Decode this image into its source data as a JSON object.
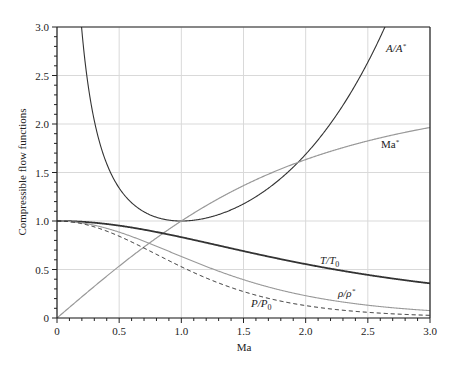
{
  "chart_data": {
    "type": "line",
    "title": "",
    "xlabel": "Ma",
    "ylabel": "Compressible flow functions",
    "xlim": [
      0,
      3.0
    ],
    "ylim": [
      0,
      3.0
    ],
    "grid": true,
    "legend": "inline labels",
    "x_ticks": [
      "0",
      "0.5",
      "1.0",
      "1.5",
      "2.0",
      "2.5",
      "3.0"
    ],
    "y_ticks": [
      "0",
      "0.5",
      "1.0",
      "1.5",
      "2.0",
      "2.5",
      "3.0"
    ],
    "x": [
      0,
      0.1,
      0.2,
      0.3,
      0.4,
      0.5,
      0.6,
      0.7,
      0.8,
      0.9,
      1.0,
      1.1,
      1.2,
      1.3,
      1.4,
      1.5,
      1.6,
      1.7,
      1.8,
      1.9,
      2.0,
      2.1,
      2.2,
      2.3,
      2.4,
      2.5,
      2.6,
      2.7,
      2.8,
      2.9,
      3.0
    ],
    "series": [
      {
        "name": "A/A*",
        "label": "A/A",
        "label_sup": "*",
        "style": "solid",
        "color": "#333333",
        "width": 1.1,
        "values": [
          null,
          5.822,
          2.964,
          2.035,
          1.59,
          1.34,
          1.188,
          1.094,
          1.038,
          1.009,
          1.0,
          1.008,
          1.03,
          1.066,
          1.115,
          1.176,
          1.25,
          1.338,
          1.439,
          1.555,
          1.688,
          1.837,
          2.005,
          2.193,
          2.403,
          2.637,
          2.896,
          3.183,
          3.5,
          3.85,
          4.235
        ]
      },
      {
        "name": "Ma*",
        "label": "Ma",
        "label_sup": "*",
        "style": "solid",
        "color": "#999999",
        "width": 1.2,
        "values": [
          0,
          0.109,
          0.218,
          0.326,
          0.431,
          0.535,
          0.635,
          0.732,
          0.825,
          0.915,
          1.0,
          1.081,
          1.158,
          1.231,
          1.3,
          1.365,
          1.425,
          1.483,
          1.536,
          1.586,
          1.633,
          1.677,
          1.718,
          1.756,
          1.792,
          1.826,
          1.857,
          1.887,
          1.914,
          1.94,
          1.964
        ]
      },
      {
        "name": "T/T0",
        "label": "T/T",
        "label_sub": "0",
        "style": "solid",
        "color": "#333333",
        "width": 1.8,
        "values": [
          1.0,
          0.998,
          0.992,
          0.982,
          0.969,
          0.952,
          0.933,
          0.911,
          0.887,
          0.861,
          0.833,
          0.805,
          0.776,
          0.747,
          0.718,
          0.69,
          0.661,
          0.634,
          0.607,
          0.581,
          0.556,
          0.531,
          0.508,
          0.486,
          0.465,
          0.444,
          0.425,
          0.407,
          0.389,
          0.373,
          0.357
        ]
      },
      {
        "name": "ρ/ρ*",
        "label": "ρ/ρ",
        "label_sup": "*",
        "style": "solid",
        "color": "#999999",
        "width": 1.1,
        "values": [
          1.0,
          0.995,
          0.98,
          0.956,
          0.924,
          0.885,
          0.84,
          0.792,
          0.74,
          0.687,
          0.634,
          0.582,
          0.531,
          0.483,
          0.437,
          0.395,
          0.356,
          0.32,
          0.287,
          0.257,
          0.23,
          0.206,
          0.184,
          0.165,
          0.147,
          0.132,
          0.118,
          0.106,
          0.095,
          0.085,
          0.076
        ]
      },
      {
        "name": "P/P0",
        "label": "P/P",
        "label_sub": "0",
        "style": "dashed",
        "color": "#222222",
        "width": 1.0,
        "values": [
          1.0,
          0.993,
          0.973,
          0.939,
          0.896,
          0.843,
          0.784,
          0.721,
          0.656,
          0.591,
          0.528,
          0.468,
          0.412,
          0.361,
          0.314,
          0.272,
          0.235,
          0.203,
          0.174,
          0.149,
          0.128,
          0.109,
          0.094,
          0.08,
          0.068,
          0.059,
          0.05,
          0.043,
          0.037,
          0.032,
          0.027
        ]
      }
    ]
  }
}
